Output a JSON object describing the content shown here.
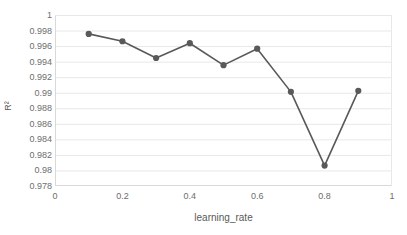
{
  "chart_data": {
    "type": "line",
    "title": "",
    "xlabel": "learning_rate",
    "ylabel": "R²",
    "x": [
      0.1,
      0.2,
      0.3,
      0.4,
      0.5,
      0.6,
      0.7,
      0.8,
      0.9
    ],
    "values": [
      0.99757,
      0.99662,
      0.99447,
      0.99637,
      0.99355,
      0.99567,
      0.99011,
      0.98063,
      0.99024
    ],
    "series": [
      {
        "name": "R²",
        "values": [
          0.99757,
          0.99662,
          0.99447,
          0.99637,
          0.99355,
          0.99567,
          0.99011,
          0.98063,
          0.99024
        ]
      }
    ],
    "xlim": [
      0,
      1
    ],
    "ylim": [
      0.978,
      1
    ],
    "xticks": [
      0,
      0.2,
      0.4,
      0.6,
      0.8,
      1
    ],
    "xtick_labels": [
      "0",
      "0.2",
      "0.4",
      "0.6",
      "0.8",
      "1"
    ],
    "yticks": [
      0.978,
      0.98,
      0.982,
      0.984,
      0.986,
      0.988,
      0.99,
      0.992,
      0.994,
      0.996,
      0.998,
      1
    ],
    "ytick_labels": [
      "0.978",
      "0.98",
      "0.982",
      "0.984",
      "0.986",
      "0.988",
      "0.99",
      "0.992",
      "0.994",
      "0.996",
      "0.998",
      "1"
    ],
    "grid": "horizontal",
    "legend": "none",
    "marker": "circle",
    "colors": {
      "line": "#595959",
      "marker": "#595959",
      "grid": "#e8e8e8",
      "axis": "#d9d9d9",
      "tick_text": "#6e6e6e",
      "title_text": "#595959",
      "background": "#ffffff"
    }
  }
}
